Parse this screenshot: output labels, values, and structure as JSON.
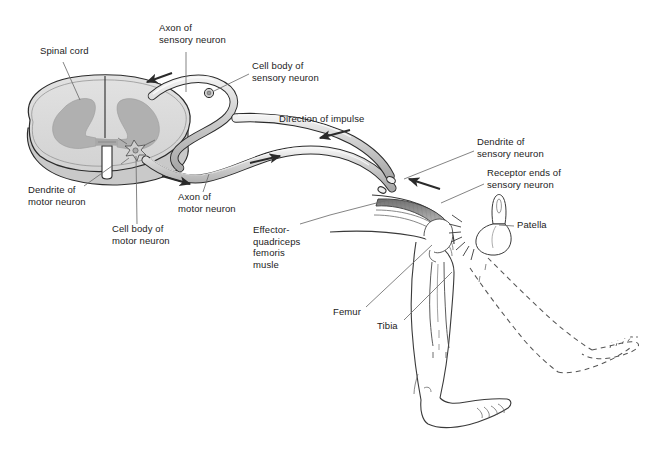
{
  "figure": {
    "domain": "anatomical line diagram",
    "background_color": "#ffffff",
    "ink_color": "#1b1b1b",
    "leader_line_color": "#6e6e6e",
    "gray_matter_color": "#b3b3b3",
    "white_matter_color": "#d9d9d9",
    "nerve_fill_color": "#d2d2d2",
    "muscle_fill_color": "#9a9a9a",
    "dashed_outline_color": "#555555"
  },
  "labels": [
    {
      "id": "spinal-cord",
      "name": "spinal-cord-label",
      "text": "Spinal cord",
      "x": 40,
      "y": 51,
      "leader_to": [
        78,
        100
      ]
    },
    {
      "id": "axon-sensory",
      "name": "axon-of-sensory-neuron-label",
      "text": "Axon of\nsensory neuron",
      "x": 159,
      "y": 26,
      "leader_to": [
        185,
        92
      ]
    },
    {
      "id": "cell-body-sensory",
      "name": "cell-body-of-sensory-neuron-label",
      "text": "Cell body of\nsensory neuron",
      "x": 252,
      "y": 65,
      "leader_to": [
        211,
        95
      ]
    },
    {
      "id": "direction-impulse",
      "name": "direction-of-impulse-label",
      "text": "Direction of impulse",
      "x": 279,
      "y": 118,
      "leader_to": null
    },
    {
      "id": "dendrite-sensory",
      "name": "dendrite-of-sensory-neuron-label",
      "text": "Dendrite of\nsensory neuron",
      "x": 477,
      "y": 141,
      "leader_to": [
        400,
        180
      ]
    },
    {
      "id": "receptor-ends",
      "name": "receptor-ends-of-sensory-neuron-label",
      "text": "Receptor ends of\nsensory neuron",
      "x": 487,
      "y": 171,
      "leader_to": [
        443,
        205
      ]
    },
    {
      "id": "patella",
      "name": "patella-label",
      "text": "Patella",
      "x": 517,
      "y": 222,
      "leader_to": [
        489,
        226
      ]
    },
    {
      "id": "dendrite-motor",
      "name": "dendrite-of-motor-neuron-label",
      "text": "Dendrite of\nmotor neuron",
      "x": 28,
      "y": 190,
      "leader_to": [
        108,
        166
      ]
    },
    {
      "id": "cell-body-motor",
      "name": "cell-body-of-motor-neuron-label",
      "text": "Cell body of\nmotor neuron",
      "x": 112,
      "y": 228,
      "leader_to": [
        134,
        150
      ]
    },
    {
      "id": "axon-motor",
      "name": "axon-of-motor-neuron-label",
      "text": "Axon of\nmotor neuron",
      "x": 178,
      "y": 196,
      "leader_to": [
        205,
        176
      ]
    },
    {
      "id": "effector-quadriceps",
      "name": "effector-quadriceps-femoris-musle-label",
      "text": "Effector-\nquadriceps\nfemoris\nmusle",
      "x": 253,
      "y": 228,
      "leader_to": [
        385,
        203
      ]
    },
    {
      "id": "femur",
      "name": "femur-label",
      "text": "Femur",
      "x": 333,
      "y": 310,
      "leader_to": [
        435,
        246
      ]
    },
    {
      "id": "tibia",
      "name": "tibia-label",
      "text": "Tibia",
      "x": 377,
      "y": 324,
      "leader_to": [
        455,
        270
      ]
    }
  ],
  "arrows": [
    {
      "id": "arrow-sensory-in",
      "name": "impulse-arrow-sensory-inbound",
      "from": [
        170,
        74
      ],
      "to": [
        146,
        82
      ]
    },
    {
      "id": "arrow-motor-out",
      "name": "impulse-arrow-motor-outbound",
      "from": [
        163,
        177
      ],
      "to": [
        190,
        184
      ]
    },
    {
      "id": "arrow-direction",
      "name": "impulse-arrow-direction-of-impulse",
      "from": [
        348,
        131
      ],
      "to": [
        320,
        138
      ]
    },
    {
      "id": "arrow-mid-out",
      "name": "impulse-arrow-midline-outbound",
      "from": [
        252,
        162
      ],
      "to": [
        280,
        156
      ]
    },
    {
      "id": "arrow-receptor",
      "name": "impulse-arrow-from-receptor",
      "from": [
        437,
        188
      ],
      "to": [
        408,
        179
      ]
    }
  ],
  "structures": [
    {
      "name": "spinal-cord-cross-section",
      "description": "oval transverse section with butterfly-shaped gray matter and central canal"
    },
    {
      "name": "gray-matter-butterfly",
      "description": "H / butterfly shaped gray matter with dorsal and ventral horns"
    },
    {
      "name": "central-canal",
      "description": "narrow central canal slit at midline"
    },
    {
      "name": "sensory-neuron-pathway",
      "description": "tube looping from dorsal root around to the leg"
    },
    {
      "name": "motor-neuron-pathway",
      "description": "tube leaving ventral horn heading to quadriceps muscle"
    },
    {
      "name": "sensory-cell-body-ganglion",
      "description": "small round cell body on dorsal root ganglion"
    },
    {
      "name": "motor-cell-body",
      "description": "star-shaped multipolar cell body in the ventral horn"
    },
    {
      "name": "quadriceps-femoris-muscle",
      "description": "striated shaded muscle belly along the thigh"
    },
    {
      "name": "patella-bone",
      "description": "kneecap shown with attached tendon"
    },
    {
      "name": "femur-bone",
      "description": "thigh bone outline inside the leg"
    },
    {
      "name": "tibia-bone",
      "description": "shin bone outline inside the lower leg"
    },
    {
      "name": "leg-resting-outline",
      "description": "solid outline of bent leg with foot pointing down"
    },
    {
      "name": "leg-kicked-outline",
      "description": "dashed outline of extended leg and foot after the reflex kick"
    },
    {
      "name": "tendon-strike-burst",
      "description": "radiating short lines at the patellar tendon indicating the tap"
    }
  ],
  "caption": {
    "text": "",
    "visible": false
  }
}
